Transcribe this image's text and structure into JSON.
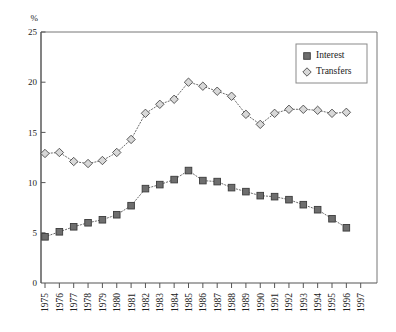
{
  "chart_data": {
    "type": "line",
    "title": "",
    "subtitle": "",
    "xlabel": "",
    "ylabel": "%",
    "y_unit": "%",
    "xlim": [
      1974.5,
      1997.5
    ],
    "ylim": [
      0,
      25
    ],
    "y_ticks": [
      0,
      5,
      10,
      15,
      20,
      25
    ],
    "y_tick_labels": [
      "0",
      "5",
      "10",
      "15",
      "20",
      "25"
    ],
    "grid": false,
    "legend_position": "top-right",
    "marker_style": {
      "Interest": "filled-square",
      "Transfers": "open-diamond"
    },
    "line_style": "dotted",
    "categories": [
      1975,
      1976,
      1977,
      1978,
      1979,
      1980,
      1981,
      1982,
      1983,
      1984,
      1985,
      1986,
      1987,
      1988,
      1989,
      1990,
      1991,
      1992,
      1993,
      1994,
      1995,
      1996
    ],
    "x_tick_labels": [
      "1975",
      "1976",
      "1977",
      "1978",
      "1979",
      "1980",
      "1981",
      "1982",
      "1983",
      "1984",
      "1985",
      "1986",
      "1987",
      "1988",
      "1989",
      "1990",
      "1991",
      "1992",
      "1993",
      "1994",
      "1995",
      "1996",
      "1997"
    ],
    "x_tick_values": [
      1975,
      1976,
      1977,
      1978,
      1979,
      1980,
      1981,
      1982,
      1983,
      1984,
      1985,
      1986,
      1987,
      1988,
      1989,
      1990,
      1991,
      1992,
      1993,
      1994,
      1995,
      1996,
      1997
    ],
    "series": [
      {
        "name": "Interest",
        "values": [
          4.6,
          5.1,
          5.6,
          6.0,
          6.3,
          6.8,
          7.7,
          9.4,
          9.8,
          10.3,
          11.2,
          10.2,
          10.1,
          9.5,
          9.1,
          8.7,
          8.6,
          8.3,
          7.8,
          7.3,
          6.4,
          5.5
        ]
      },
      {
        "name": "Transfers",
        "values": [
          12.9,
          13.0,
          12.1,
          11.9,
          12.2,
          13.0,
          14.3,
          16.9,
          17.8,
          18.3,
          20.0,
          19.6,
          19.1,
          18.6,
          16.8,
          15.8,
          16.9,
          17.3,
          17.3,
          17.2,
          16.9,
          17.0
        ]
      }
    ]
  },
  "legend": {
    "entries": [
      {
        "label": "Interest",
        "marker": "filled-square"
      },
      {
        "label": "Transfers",
        "marker": "open-diamond"
      }
    ]
  },
  "colors": {
    "interest_marker": "#6e6e6e",
    "transfers_marker": "#d8d8d8",
    "line": "#6b6b6b",
    "axis": "#555555",
    "text": "#1a1a1a",
    "background": "#ffffff"
  }
}
